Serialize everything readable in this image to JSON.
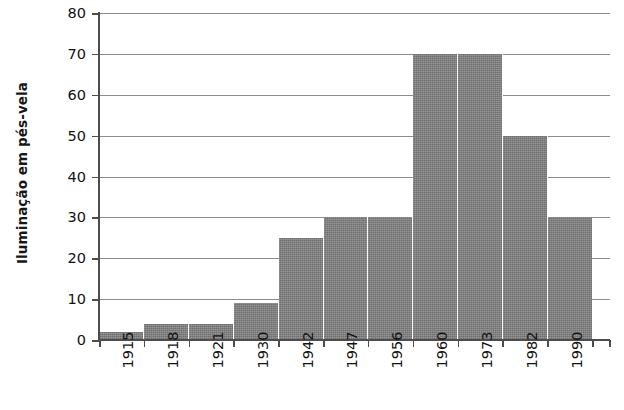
{
  "chart_data": {
    "type": "bar",
    "title": "",
    "subtitle": "",
    "xlabel": "",
    "ylabel": "Iluminação em pés-vela",
    "categories": [
      "1915",
      "1918",
      "1921",
      "1930",
      "1942",
      "1947",
      "1956",
      "1960",
      "1973",
      "1982",
      "1990"
    ],
    "values": [
      2,
      4,
      4,
      9,
      25,
      30,
      30,
      70,
      70,
      50,
      30
    ],
    "ylim": [
      0,
      80
    ],
    "ytick_values": [
      0,
      10,
      20,
      30,
      40,
      50,
      60,
      70,
      80
    ],
    "ytick_labels": [
      "0",
      "10",
      "20",
      "30",
      "40",
      "50",
      "60",
      "70",
      "80"
    ],
    "grid": true,
    "grid_axis": "y",
    "legend": false,
    "legend_position": "none",
    "bar_color": "#808080",
    "grid_color": "#8c8c8c",
    "axis_color": "#4d4d4d",
    "background_color": "#ffffff",
    "annotations": []
  }
}
